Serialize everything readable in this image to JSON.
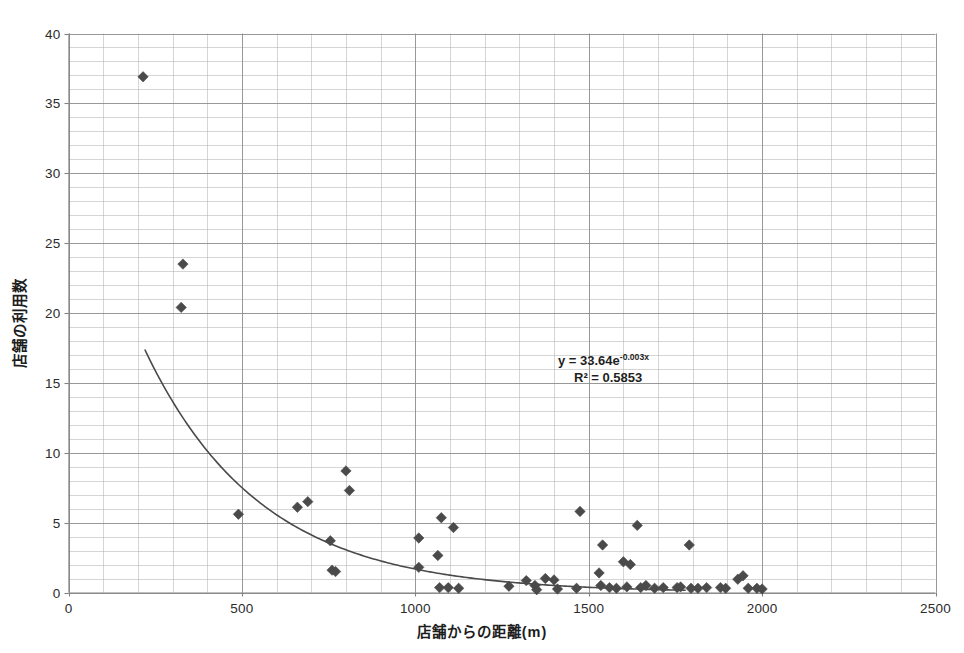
{
  "chart_data": {
    "type": "scatter",
    "title": "",
    "xlabel": "店舗からの距離(m)",
    "ylabel": "店舗の利用数",
    "xlim": [
      0,
      2500
    ],
    "ylim": [
      0,
      40
    ],
    "xticks": [
      0,
      500,
      1000,
      1500,
      2000,
      2500
    ],
    "yticks": [
      0,
      5,
      10,
      15,
      20,
      25,
      30,
      35,
      40
    ],
    "x_major_step": 500,
    "x_minor_step": 100,
    "y_major_step": 5,
    "y_minor_step": 1,
    "grid": true,
    "legend": false,
    "marker": "diamond",
    "marker_color": "#4a4a4a",
    "trendline_color": "#4a4a4a",
    "gridline_color": "#b9b9b9",
    "axis_color": "#808080",
    "annotations": [
      {
        "id": "equation",
        "text": "y = 33.64e",
        "exponent": "-0.003x"
      },
      {
        "id": "r-squared",
        "text": "R² = 0.5853"
      }
    ],
    "trendline": {
      "type": "exponential",
      "equation": "y = 33.64e^(-0.003x)",
      "coefficient": 33.64,
      "rate": -0.003,
      "r_squared": 0.5853,
      "x_start": 220,
      "x_end": 1780
    },
    "points": [
      [
        215,
        36.9
      ],
      [
        330,
        23.5
      ],
      [
        325,
        20.4
      ],
      [
        490,
        5.6
      ],
      [
        660,
        6.1
      ],
      [
        690,
        6.5
      ],
      [
        755,
        3.7
      ],
      [
        760,
        1.6
      ],
      [
        770,
        1.5
      ],
      [
        800,
        8.7
      ],
      [
        810,
        7.3
      ],
      [
        1010,
        3.9
      ],
      [
        1010,
        1.8
      ],
      [
        1065,
        2.65
      ],
      [
        1075,
        5.35
      ],
      [
        1070,
        0.35
      ],
      [
        1095,
        0.35
      ],
      [
        1110,
        4.65
      ],
      [
        1125,
        0.3
      ],
      [
        1270,
        0.45
      ],
      [
        1320,
        0.85
      ],
      [
        1345,
        0.5
      ],
      [
        1350,
        0.2
      ],
      [
        1375,
        1.0
      ],
      [
        1400,
        0.9
      ],
      [
        1410,
        0.25
      ],
      [
        1465,
        0.3
      ],
      [
        1475,
        5.8
      ],
      [
        1530,
        1.4
      ],
      [
        1540,
        3.4
      ],
      [
        1535,
        0.5
      ],
      [
        1560,
        0.35
      ],
      [
        1580,
        0.3
      ],
      [
        1600,
        2.2
      ],
      [
        1610,
        0.4
      ],
      [
        1620,
        2.0
      ],
      [
        1640,
        4.8
      ],
      [
        1650,
        0.35
      ],
      [
        1665,
        0.5
      ],
      [
        1690,
        0.3
      ],
      [
        1715,
        0.35
      ],
      [
        1755,
        0.35
      ],
      [
        1765,
        0.4
      ],
      [
        1790,
        3.4
      ],
      [
        1795,
        0.3
      ],
      [
        1815,
        0.3
      ],
      [
        1840,
        0.35
      ],
      [
        1880,
        0.35
      ],
      [
        1895,
        0.3
      ],
      [
        1930,
        0.95
      ],
      [
        1945,
        1.2
      ],
      [
        1960,
        0.3
      ],
      [
        1985,
        0.3
      ],
      [
        2000,
        0.25
      ]
    ]
  },
  "axis": {
    "x_title": "店舗からの距離(m)",
    "y_title": "店舗の利用数"
  }
}
